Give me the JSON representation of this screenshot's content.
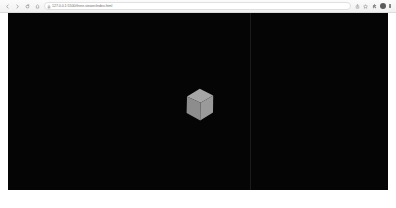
{
  "browser": {
    "nav": {
      "back_label": "‹",
      "forward_label": "›",
      "reload_label": "↻",
      "home_label": "⌂"
    },
    "omnibox": {
      "security_icon": "lock-icon",
      "url": "127.0.0.1:5500/three-viewer/index.html",
      "placeholder": "Search Google or type a URL"
    },
    "toolbar_right": {
      "share_label": "⇧",
      "star_label": "☆",
      "extensions_label": "⬡",
      "profile_label": "●",
      "menu_label": "⋮"
    }
  },
  "page": {
    "canvas": {
      "background_color": "#050505",
      "divider_color": "#1b1b1b",
      "divider_x": 242
    },
    "cube": {
      "label": "3d-cube",
      "top_face_color": "#a8a8a8",
      "left_face_color": "#8e8e8e",
      "right_face_color": "#9b9b9b",
      "edge_color": "#b0b0b0"
    }
  }
}
